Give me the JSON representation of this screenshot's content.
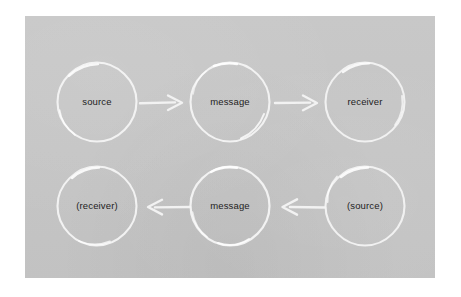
{
  "diagram": {
    "type": "flow-diagram",
    "panel_color": "#c6c6c6",
    "stroke_color": "#f2f2f2",
    "text_color": "#1d1d1d",
    "rows": [
      {
        "name": "forward-channel",
        "direction": "left-to-right",
        "nodes": [
          {
            "id": "source",
            "label": "source"
          },
          {
            "id": "message-top",
            "label": "message"
          },
          {
            "id": "receiver",
            "label": "receiver"
          }
        ],
        "arrows": [
          {
            "id": "source-to-message",
            "direction": "right"
          },
          {
            "id": "message-to-receiver",
            "direction": "right"
          }
        ]
      },
      {
        "name": "feedback-channel",
        "direction": "right-to-left",
        "nodes": [
          {
            "id": "receiver-paren",
            "label": "(receiver)"
          },
          {
            "id": "message-bottom",
            "label": "message"
          },
          {
            "id": "source-paren",
            "label": "(source)"
          }
        ],
        "arrows": [
          {
            "id": "message-to-receiver-back",
            "direction": "left"
          },
          {
            "id": "source-to-message-back",
            "direction": "left"
          }
        ]
      }
    ]
  }
}
